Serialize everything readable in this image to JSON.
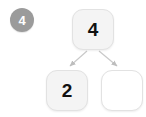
{
  "diagram": {
    "type": "binary-tree",
    "step_badge": {
      "label": "4",
      "color": "#9b9b9b",
      "text_color": "#ffffff"
    },
    "nodes": [
      {
        "id": "root",
        "label": "4",
        "state": "filled",
        "fill": "#f4f4f4"
      },
      {
        "id": "left",
        "label": "2",
        "state": "filled",
        "fill": "#f4f4f4"
      },
      {
        "id": "right",
        "label": "",
        "state": "empty",
        "fill": "#ffffff"
      }
    ],
    "edges": [
      {
        "from": "root",
        "to": "left",
        "arrow": true
      },
      {
        "from": "root",
        "to": "right",
        "arrow": true
      }
    ],
    "colors": {
      "node_border": "#e2e2e2",
      "edge": "#c9c9c9",
      "background": "#ffffff"
    }
  }
}
